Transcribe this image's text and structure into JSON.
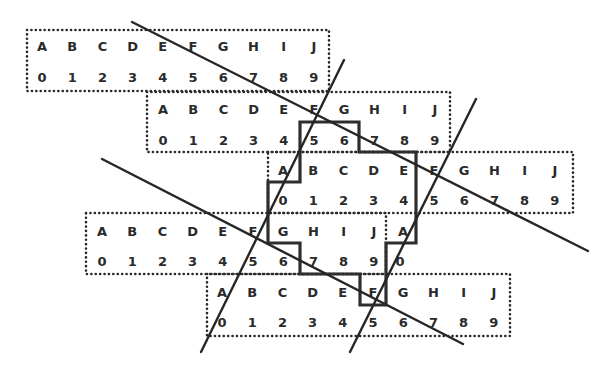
{
  "diagram": {
    "letters": [
      "A",
      "B",
      "C",
      "D",
      "E",
      "F",
      "G",
      "H",
      "I",
      "J"
    ],
    "digits": [
      "0",
      "1",
      "2",
      "3",
      "4",
      "5",
      "6",
      "7",
      "8",
      "9"
    ],
    "strips": [
      {
        "id": "strip-1",
        "letters": [
          "A",
          "B",
          "C",
          "D",
          "E",
          "F",
          "G",
          "H",
          "I",
          "J"
        ],
        "digits": [
          "0",
          "1",
          "2",
          "3",
          "4",
          "5",
          "6",
          "7",
          "8",
          "9"
        ]
      },
      {
        "id": "strip-2",
        "letters": [
          "A",
          "B",
          "C",
          "D",
          "E",
          "F",
          "G",
          "H",
          "I",
          "J"
        ],
        "digits": [
          "0",
          "1",
          "2",
          "3",
          "4",
          "5",
          "6",
          "7",
          "8",
          "9"
        ]
      },
      {
        "id": "strip-3",
        "letters": [
          "A",
          "B",
          "C",
          "D",
          "E",
          "F",
          "G",
          "H",
          "I",
          "J"
        ],
        "digits": [
          "0",
          "1",
          "2",
          "3",
          "4",
          "5",
          "6",
          "7",
          "8",
          "9"
        ]
      },
      {
        "id": "strip-4",
        "letters": [
          "A",
          "B",
          "C",
          "D",
          "E",
          "F",
          "G",
          "H",
          "I",
          "J",
          "A"
        ],
        "digits": [
          "0",
          "1",
          "2",
          "3",
          "4",
          "5",
          "6",
          "7",
          "8",
          "9",
          "0"
        ]
      },
      {
        "id": "strip-5",
        "letters": [
          "A",
          "B",
          "C",
          "D",
          "E",
          "F",
          "G",
          "H",
          "I",
          "J"
        ],
        "digits": [
          "0",
          "1",
          "2",
          "3",
          "4",
          "5",
          "6",
          "7",
          "8",
          "9"
        ]
      }
    ],
    "colors": {
      "ink": "#2a2a2a",
      "background": "#ffffff"
    }
  }
}
